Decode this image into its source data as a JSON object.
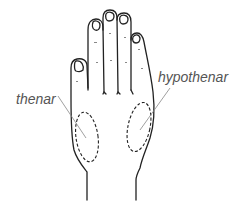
{
  "diagram": {
    "labels": [
      {
        "id": "thenar",
        "text": "thenar"
      },
      {
        "id": "hypothenar",
        "text": "hypothenar"
      }
    ],
    "regions": [
      {
        "id": "thenar-region",
        "style": "dashed-ellipse"
      },
      {
        "id": "hypothenar-region",
        "style": "dashed-ellipse"
      }
    ],
    "colors": {
      "outline": "#222222",
      "leader_line": "#888888",
      "label_text": "#555555",
      "background": "#ffffff"
    }
  }
}
